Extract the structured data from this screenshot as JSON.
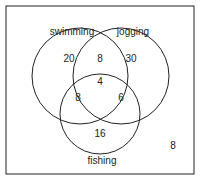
{
  "diagram": {
    "type": "venn",
    "sets": [
      {
        "label": "swimming",
        "only": "20"
      },
      {
        "label": "jogging",
        "only": "30"
      },
      {
        "label": "fishing",
        "only": "16"
      }
    ],
    "regions": {
      "swimming_jogging": "8",
      "swimming_fishing": "8",
      "jogging_fishing": "6",
      "all_three": "4",
      "outside": "8"
    }
  }
}
